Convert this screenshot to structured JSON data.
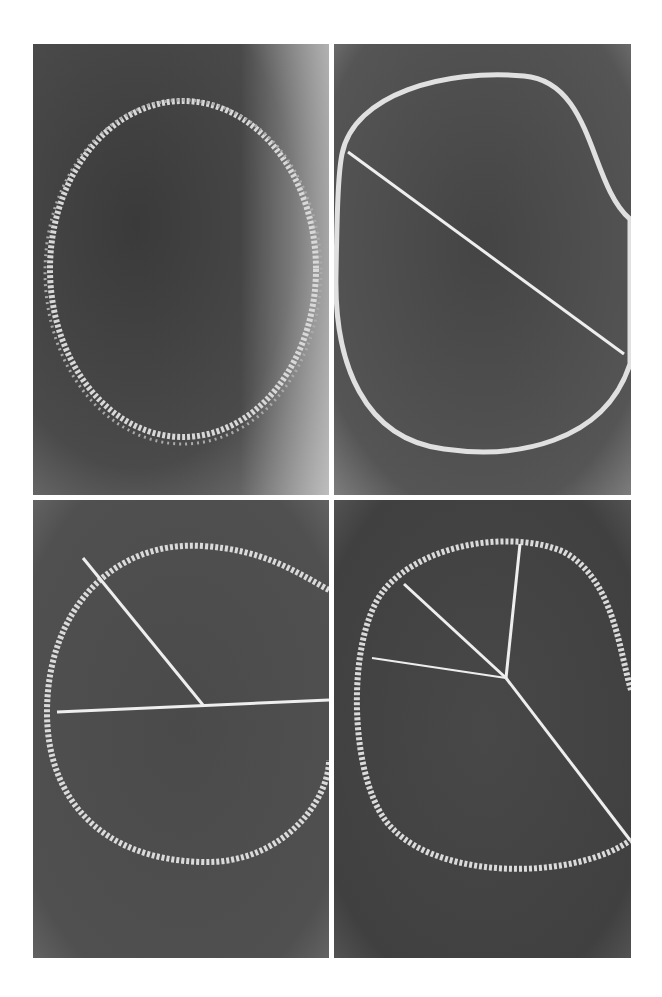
{
  "figure": {
    "layout": "2x2 grid",
    "panels": [
      {
        "id": "a",
        "description": "Chalk circle drawn on dark board, no lines"
      },
      {
        "id": "b",
        "description": "Chalk circle with one diagonal chord"
      },
      {
        "id": "c",
        "description": "Chalk circle with a horizontal diameter and one radius"
      },
      {
        "id": "d",
        "description": "Chalk circle divided by four radii from center"
      }
    ]
  }
}
